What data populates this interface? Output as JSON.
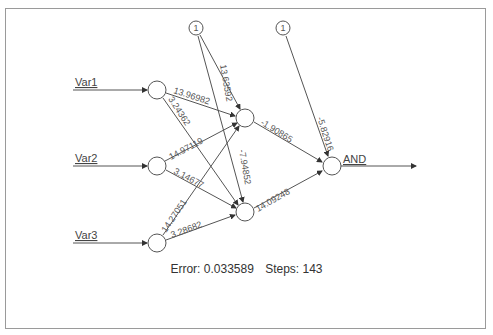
{
  "diagram": {
    "type": "neural-network",
    "inputs": [
      {
        "label": "Var1"
      },
      {
        "label": "Var2"
      },
      {
        "label": "Var3"
      }
    ],
    "output": {
      "label": "AND"
    },
    "bias_nodes": [
      {
        "label": "1"
      },
      {
        "label": "1"
      }
    ],
    "weights": {
      "var1_h1": "13.96982",
      "var1_h2": "3.24362",
      "var2_h1": "14.97119",
      "var2_h2": "3.14677",
      "var3_h1": "14.27051",
      "var3_h2": "3.28682",
      "bias1_h1": "13.63592",
      "bias1_h2": "-7.94852",
      "h1_out": "-1.90865",
      "h2_out": "14.09248",
      "bias2_out": "-5.82916"
    }
  },
  "status": {
    "error_label": "Error: 0.033589",
    "steps_label": "Steps: 143"
  }
}
